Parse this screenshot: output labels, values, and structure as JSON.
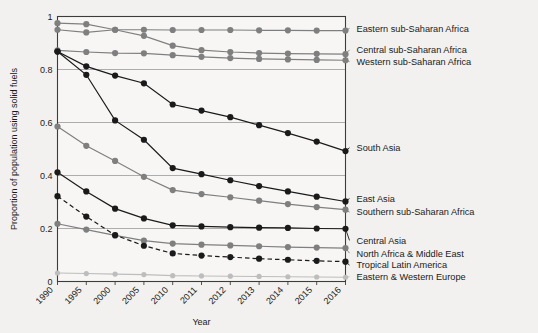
{
  "chart_data": {
    "type": "line",
    "title": "",
    "xlabel": "Year",
    "ylabel": "Proportion of population using solid fuels",
    "x": [
      1990,
      1995,
      2000,
      2005,
      2010,
      2011,
      2012,
      2013,
      2014,
      2015,
      2016
    ],
    "categories": [
      "1990",
      "1995",
      "2000",
      "2005",
      "2010",
      "2011",
      "2012",
      "2013",
      "2014",
      "2015",
      "2016"
    ],
    "xtick_labels": [
      "1990",
      "1995",
      "2000",
      "2005",
      "2010",
      "2011",
      "2012",
      "2013",
      "2014",
      "2015",
      "2016"
    ],
    "ytick_labels": [
      "0",
      "0.2",
      "0.4",
      "0.6",
      "0.8",
      "1"
    ],
    "yticks": [
      0,
      0.2,
      0.4,
      0.6,
      0.8,
      1
    ],
    "ylim": [
      0,
      1
    ],
    "grid": "horizontal",
    "legend_position": "right-inline-labels",
    "series": [
      {
        "name": "Eastern sub-Saharan Africa",
        "color": "#7f7f7f",
        "style": "solid",
        "label_y": 0.955,
        "values": [
          0.975,
          0.971,
          0.95,
          0.95,
          0.949,
          0.949,
          0.949,
          0.948,
          0.948,
          0.947,
          0.947
        ]
      },
      {
        "name": "Central sub-Saharan Africa",
        "color": "#7f7f7f",
        "style": "solid",
        "label_y": 0.874,
        "values": [
          0.95,
          0.94,
          0.95,
          0.927,
          0.89,
          0.873,
          0.866,
          0.862,
          0.86,
          0.859,
          0.858
        ]
      },
      {
        "name": "Western sub-Saharan Africa",
        "color": "#7f7f7f",
        "style": "solid",
        "label_y": 0.83,
        "values": [
          0.872,
          0.866,
          0.862,
          0.861,
          0.854,
          0.848,
          0.843,
          0.84,
          0.838,
          0.836,
          0.835
        ]
      },
      {
        "name": "South Asia",
        "color": "#1a1a1a",
        "style": "solid",
        "label_y": 0.505,
        "values": [
          0.868,
          0.812,
          0.777,
          0.748,
          0.668,
          0.645,
          0.62,
          0.59,
          0.56,
          0.528,
          0.492
        ]
      },
      {
        "name": "East Asia",
        "color": "#1a1a1a",
        "style": "solid",
        "label_y": 0.313,
        "values": [
          0.868,
          0.78,
          0.608,
          0.535,
          0.428,
          0.405,
          0.382,
          0.36,
          0.34,
          0.32,
          0.302
        ]
      },
      {
        "name": "Southern sub-Saharan Africa",
        "color": "#7f7f7f",
        "style": "solid",
        "label_y": 0.262,
        "values": [
          0.585,
          0.512,
          0.455,
          0.395,
          0.345,
          0.33,
          0.318,
          0.305,
          0.292,
          0.281,
          0.271
        ]
      },
      {
        "name": "Central Asia",
        "color": "#1a1a1a",
        "style": "solid",
        "label_y": 0.155,
        "values": [
          0.412,
          0.34,
          0.275,
          0.238,
          0.212,
          0.208,
          0.205,
          0.203,
          0.202,
          0.2,
          0.199
        ]
      },
      {
        "name": "North Africa & Middle East",
        "color": "#7f7f7f",
        "style": "solid",
        "label_y": 0.107,
        "values": [
          0.218,
          0.196,
          0.174,
          0.154,
          0.143,
          0.139,
          0.136,
          0.133,
          0.13,
          0.128,
          0.126
        ]
      },
      {
        "name": "Tropical Latin America",
        "color": "#1a1a1a",
        "style": "dashed",
        "label_y": 0.062,
        "values": [
          0.322,
          0.245,
          0.175,
          0.135,
          0.106,
          0.098,
          0.092,
          0.086,
          0.082,
          0.078,
          0.075
        ]
      },
      {
        "name": "Eastern & Western Europe",
        "color": "#bdbdbd",
        "style": "solid",
        "label_y": 0.018,
        "values": [
          0.032,
          0.03,
          0.028,
          0.026,
          0.022,
          0.021,
          0.02,
          0.019,
          0.018,
          0.017,
          0.016
        ]
      }
    ]
  },
  "axes": {
    "x_title": "Year",
    "y_title": "Proportion of population using solid fuels"
  },
  "colors": {
    "background": "#f2f1ef",
    "dark": "#1a1a1a",
    "mid_gray": "#7f7f7f",
    "light_gray": "#bdbdbd",
    "grid": "#9a9a9a",
    "frame": "#3c3c3c"
  }
}
